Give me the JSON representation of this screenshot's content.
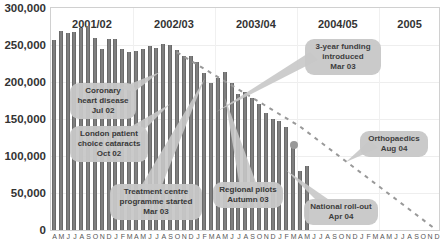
{
  "chart_data": {
    "type": "bar",
    "title": "",
    "xlabel": "",
    "ylabel": "",
    "ylim": [
      0,
      300000
    ],
    "y_ticks": [
      "300,000",
      "250,000",
      "200,000",
      "150,000",
      "100,000",
      "50,000",
      "0"
    ],
    "period_labels": [
      "2001/02",
      "2002/03",
      "2003/04",
      "2004/05",
      "2005"
    ],
    "month_labels": [
      "A",
      "M",
      "J",
      "J",
      "A",
      "S",
      "O",
      "N",
      "D",
      "J",
      "F",
      "M",
      "A",
      "M",
      "J",
      "J",
      "A",
      "S",
      "O",
      "N",
      "D",
      "J",
      "F",
      "M",
      "A",
      "M",
      "J",
      "J",
      "A",
      "S",
      "O",
      "N",
      "D",
      "J",
      "F",
      "M",
      "A",
      "M",
      "J",
      "J",
      "A",
      "S",
      "O",
      "N",
      "D",
      "J",
      "F",
      "M",
      "A",
      "M",
      "J",
      "J",
      "A",
      "S",
      "O",
      "N",
      "D"
    ],
    "categories": [
      "Apr 01",
      "May 01",
      "Jun 01",
      "Jul 01",
      "Aug 01",
      "Sep 01",
      "Oct 01",
      "Nov 01",
      "Dec 01",
      "Jan 02",
      "Feb 02",
      "Mar 02",
      "Apr 02",
      "May 02",
      "Jun 02",
      "Jul 02",
      "Aug 02",
      "Sep 02",
      "Oct 02",
      "Nov 02",
      "Dec 02",
      "Jan 03",
      "Feb 03",
      "Mar 03",
      "Apr 03",
      "May 03",
      "Jun 03",
      "Jul 03",
      "Aug 03",
      "Sep 03",
      "Oct 03",
      "Nov 03",
      "Dec 03",
      "Jan 04",
      "Feb 04",
      "Mar 04",
      "Apr 04",
      "May 04"
    ],
    "series": [
      {
        "name": "Waiting list",
        "values": [
          257000,
          269000,
          266000,
          267000,
          273000,
          276000,
          260000,
          245000,
          258000,
          258000,
          244000,
          240000,
          242000,
          244000,
          249000,
          246000,
          252000,
          250000,
          243000,
          235000,
          235000,
          227000,
          212000,
          198000,
          206000,
          213000,
          198000,
          184000,
          186000,
          179000,
          170000,
          158000,
          150000,
          147000,
          139000,
          116000,
          80000,
          86000
        ]
      },
      {
        "name": "Trend (projected)",
        "type": "line",
        "style": "dashed",
        "points": [
          [
            "Oct 02",
            240000
          ],
          [
            "Apr 04",
            140000
          ],
          [
            "Dec 05",
            0
          ]
        ]
      }
    ],
    "marker": {
      "x": "Apr 04",
      "y": 142000,
      "shape": "circle"
    },
    "annotations": [
      {
        "text": "Coronary heart disease Jul 02"
      },
      {
        "text": "London patient choice cataracts Oct 02"
      },
      {
        "text": "Treatment centre programme started Mar 03"
      },
      {
        "text": "3-year funding introduced Mar 03"
      },
      {
        "text": "Regional pilots Autumn 03"
      },
      {
        "text": "National roll-out Apr 04"
      },
      {
        "text": "Orthopaedics Aug 04"
      }
    ],
    "grid": true,
    "legend": "none"
  },
  "callouts": {
    "chd": [
      "Coronary",
      "heart disease",
      "Jul 02"
    ],
    "london": [
      "London patient",
      "choice cataracts",
      "Oct 02"
    ],
    "treatment": [
      "Treatment centre",
      "programme started",
      "Mar 03"
    ],
    "funding": [
      "3-year funding",
      "introduced",
      "Mar 03"
    ],
    "regional": [
      "Regional pilots",
      "Autumn 03"
    ],
    "national": [
      "National roll-out",
      "Apr 04"
    ],
    "ortho": [
      "Orthopaedics",
      "Aug 04"
    ]
  }
}
